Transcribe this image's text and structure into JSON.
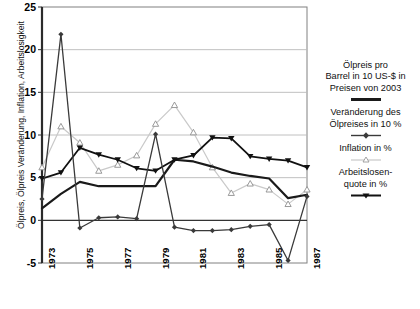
{
  "chart_data": {
    "type": "line",
    "title": "",
    "xlabel": "",
    "ylabel": "Ölpreis, Ölpreis Veränderung, Inflation, Arbeitslosigkeit",
    "x": [
      1973,
      1974,
      1975,
      1976,
      1977,
      1978,
      1979,
      1980,
      1981,
      1982,
      1983,
      1984,
      1985,
      1986,
      1987
    ],
    "xtick_labels": [
      "1973",
      "1975",
      "1977",
      "1979",
      "1981",
      "1983",
      "1985",
      "1987"
    ],
    "xtick_values": [
      1973,
      1975,
      1977,
      1979,
      1981,
      1983,
      1985,
      1987
    ],
    "ylim": [
      -5,
      25
    ],
    "ytick_labels": [
      "-5",
      "0",
      "5",
      "10",
      "15",
      "20",
      "25"
    ],
    "ytick_values": [
      -5,
      0,
      5,
      10,
      15,
      20,
      25
    ],
    "grid": true,
    "legend_position": "right",
    "series": [
      {
        "name": "Ölpreis pro Barrel in 10 US-$ in Preisen von 2003",
        "color": "#1a1a1a",
        "marker": "none",
        "linewidth": 2.2,
        "values": [
          1.4,
          3.1,
          4.5,
          4.0,
          4.0,
          4.0,
          4.0,
          7.1,
          6.9,
          6.3,
          5.6,
          5.2,
          4.9,
          2.6,
          3.0
        ]
      },
      {
        "name": "Veränderung des Ölpreises in 10 %",
        "color": "#3a3a3a",
        "marker": "diamond",
        "linewidth": 1.3,
        "values": [
          2.5,
          21.8,
          -0.9,
          0.3,
          0.4,
          0.2,
          10.1,
          -0.8,
          -1.2,
          -1.2,
          -1.1,
          -0.7,
          -0.5,
          -4.7,
          2.8
        ]
      },
      {
        "name": "Inflation in %",
        "color": "#c9c9c9",
        "marker": "triangle-up",
        "linewidth": 1.2,
        "values": [
          6.2,
          11.0,
          9.1,
          5.8,
          6.5,
          7.6,
          11.3,
          13.5,
          10.3,
          6.2,
          3.2,
          4.3,
          3.6,
          1.9,
          3.6
        ]
      },
      {
        "name": "Arbeitslosenquote in %",
        "color": "#111111",
        "marker": "triangle-down",
        "linewidth": 1.8,
        "values": [
          4.9,
          5.6,
          8.5,
          7.7,
          7.1,
          6.1,
          5.8,
          7.1,
          7.6,
          9.7,
          9.6,
          7.5,
          7.2,
          7.0,
          6.2
        ]
      }
    ]
  },
  "legend": {
    "entries": [
      {
        "label_line1": "Ölpreis pro",
        "label_line2": "Barrel in 10 US-$ in",
        "label_line3": "Preisen von 2003",
        "key": "thick-line"
      },
      {
        "label_line1": "Veränderung des",
        "label_line2": "Ölpreises in 10 %",
        "label_line3": "",
        "key": "diamond-line"
      },
      {
        "label_line1": "Inflation in %",
        "label_line2": "",
        "label_line3": "",
        "key": "triangle-up-line"
      },
      {
        "label_line1": "Arbeitslosen-",
        "label_line2": "quote in %",
        "label_line3": "",
        "key": "triangle-down-line"
      }
    ]
  },
  "axes": {
    "y_ticks": [
      "25",
      "20",
      "15",
      "10",
      "5",
      "0",
      "-5"
    ],
    "x_ticks": [
      "1973",
      "1975",
      "1977",
      "1979",
      "1981",
      "1983",
      "1985",
      "1987"
    ]
  }
}
